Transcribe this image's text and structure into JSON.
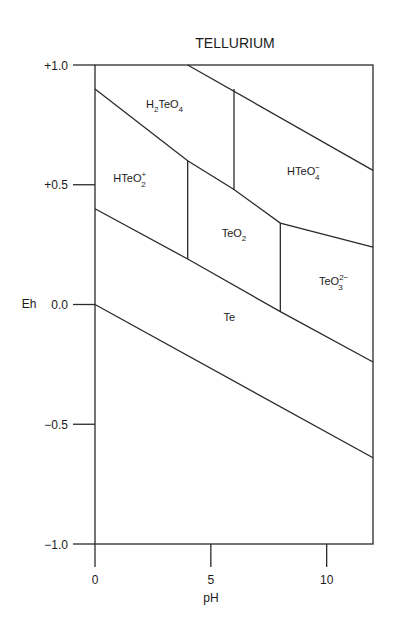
{
  "chart_data": {
    "type": "diagram",
    "title": "TELLURIUM",
    "xlabel": "pH",
    "ylabel": "Eh",
    "xlim": [
      0,
      12
    ],
    "ylim": [
      -1.0,
      1.0
    ],
    "x_ticks": [
      {
        "value": 0,
        "label": "0"
      },
      {
        "value": 5,
        "label": "5"
      },
      {
        "value": 10,
        "label": "10"
      }
    ],
    "y_ticks": [
      {
        "value": 1.0,
        "label": "+1.0"
      },
      {
        "value": 0.5,
        "label": "+0.5"
      },
      {
        "value": 0.0,
        "label": "0.0"
      },
      {
        "value": -0.5,
        "label": "−0.5"
      },
      {
        "value": -1.0,
        "label": "−1.0"
      }
    ],
    "grid": false,
    "boundaries": [
      {
        "name": "H2TeO4-HTeO2+/TeO2/TeO3 upper boundary",
        "points": [
          [
            0,
            0.9
          ],
          [
            4.0,
            0.6
          ],
          [
            6.0,
            0.48
          ],
          [
            8.0,
            0.34
          ],
          [
            12.0,
            0.24
          ]
        ]
      },
      {
        "name": "H2TeO4-HTeO4- upper diagonal",
        "points": [
          [
            4.0,
            1.0
          ],
          [
            12.0,
            0.56
          ]
        ]
      },
      {
        "name": "H2TeO4 / HTeO4- vertical",
        "points": [
          [
            6.0,
            0.9
          ],
          [
            6.0,
            0.48
          ]
        ]
      },
      {
        "name": "HTeO2+ / TeO2 vertical",
        "points": [
          [
            4.0,
            0.6
          ],
          [
            4.0,
            0.19
          ]
        ]
      },
      {
        "name": "TeO2 / TeO3 2- vertical",
        "points": [
          [
            8.0,
            0.34
          ],
          [
            8.0,
            -0.03
          ]
        ]
      },
      {
        "name": "Te upper boundary",
        "points": [
          [
            0,
            0.4
          ],
          [
            4.0,
            0.19
          ],
          [
            8.0,
            -0.03
          ],
          [
            12.0,
            -0.24
          ]
        ]
      },
      {
        "name": "Te lower boundary",
        "points": [
          [
            0,
            0.0
          ],
          [
            12.0,
            -0.64
          ]
        ]
      }
    ],
    "regions": [
      {
        "species": "H2TeO4",
        "label_main": "H",
        "sub1": "2",
        "mid": "TeO",
        "sub2": "4",
        "sup": "",
        "x": 3.0,
        "y": 0.82
      },
      {
        "species": "HTeO2+",
        "label_main": "HTeO",
        "sub": "2",
        "sup": "+",
        "x": 1.5,
        "y": 0.51
      },
      {
        "species": "HTeO4-",
        "label_main": "HTeO",
        "sub": "4",
        "sup": "−",
        "x": 9.0,
        "y": 0.54
      },
      {
        "species": "TeO2",
        "label_main": "TeO",
        "sub": "2",
        "sup": "",
        "x": 6.0,
        "y": 0.28
      },
      {
        "species": "TeO3 2-",
        "label_main": "TeO",
        "sub": "3",
        "sup": "2−",
        "x": 10.3,
        "y": 0.08
      },
      {
        "species": "Te",
        "label_main": "Te",
        "sub": "",
        "sup": "",
        "x": 5.8,
        "y": -0.07
      }
    ]
  }
}
